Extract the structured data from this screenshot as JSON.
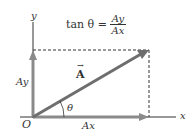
{
  "diagram": {
    "title_formula": {
      "prefix": "tan θ =",
      "numerator": "Ay",
      "denominator": "Ax"
    },
    "axes": {
      "x_label": "x",
      "y_label": "y",
      "origin_label": "O"
    },
    "vector": {
      "label": "A",
      "arrow": "→"
    },
    "components": {
      "x_component": "Ax",
      "y_component": "Ay"
    },
    "angle_label": "θ",
    "colors": {
      "vector": "#7a7a7a",
      "axes": "#333333",
      "dashed": "#333333"
    }
  }
}
